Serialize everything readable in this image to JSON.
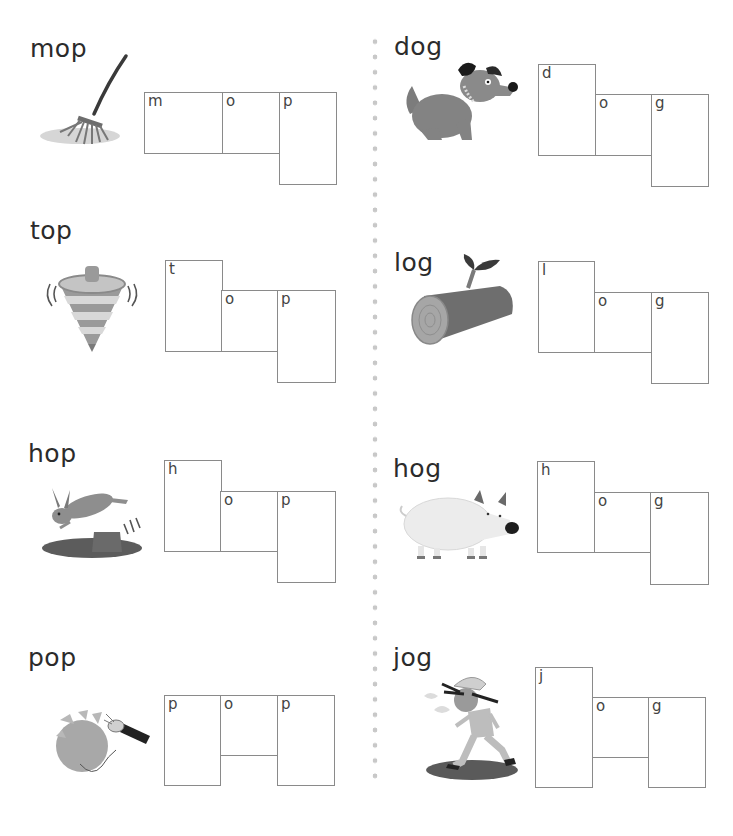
{
  "worksheet": {
    "columns": [
      {
        "vowel_family": "op",
        "items": [
          {
            "word": "mop",
            "picture": "mop-illustration",
            "letters": [
              "m",
              "o",
              "p"
            ]
          },
          {
            "word": "top",
            "picture": "spinning-top-illustration",
            "letters": [
              "t",
              "o",
              "p"
            ]
          },
          {
            "word": "hop",
            "picture": "hopping-rabbit-illustration",
            "letters": [
              "h",
              "o",
              "p"
            ]
          },
          {
            "word": "pop",
            "picture": "popping-balloon-illustration",
            "letters": [
              "p",
              "o",
              "p"
            ]
          }
        ]
      },
      {
        "vowel_family": "og",
        "items": [
          {
            "word": "dog",
            "picture": "dog-illustration",
            "letters": [
              "d",
              "o",
              "g"
            ]
          },
          {
            "word": "log",
            "picture": "log-illustration",
            "letters": [
              "l",
              "o",
              "g"
            ]
          },
          {
            "word": "hog",
            "picture": "hog-illustration",
            "letters": [
              "h",
              "o",
              "g"
            ]
          },
          {
            "word": "jog",
            "picture": "jogging-child-illustration",
            "letters": [
              "j",
              "o",
              "g"
            ]
          }
        ]
      }
    ]
  },
  "colors": {
    "text": "#2b2b2b",
    "box_border": "#8a8a8a",
    "divider_dots": "#c8c8c8",
    "illustration_gray": "#8c8c8c"
  }
}
